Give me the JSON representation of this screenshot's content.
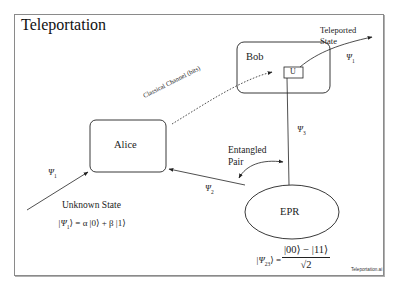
{
  "title": "Teleportation",
  "nodes": {
    "alice": "Alice",
    "bob": "Bob",
    "unitary": "U",
    "epr": "EPR"
  },
  "labels": {
    "classical_channel": "Classical Channel (bits)",
    "teleported_line1": "Teleported",
    "teleported_line2": "State",
    "entangled_line1": "Entangled",
    "entangled_line2": "Pair",
    "unknown_state": "Unknown State"
  },
  "states": {
    "psi1_input": "Ψ",
    "psi1_input_sub": "1",
    "psi1_output": "Ψ",
    "psi1_output_sub": "1",
    "psi2": "Ψ",
    "psi2_sub": "2",
    "psi3": "Ψ",
    "psi3_sub": "3"
  },
  "equations": {
    "unknown_lhs": "|Ψ",
    "unknown_lhs_sub": "1",
    "unknown_rhs": "⟩ = α |0⟩ + β |1⟩",
    "bell_lhs": "|Ψ",
    "bell_lhs_sub": "23",
    "bell_lhs_close": "⟩ =",
    "bell_numerator": "|00⟩ − |11⟩",
    "bell_denominator": "√2"
  },
  "footer": {
    "credit": "Teleportation.ai"
  },
  "colors": {
    "stroke": "#222222",
    "frame": "#8a8a8a",
    "background": "#ffffff"
  }
}
